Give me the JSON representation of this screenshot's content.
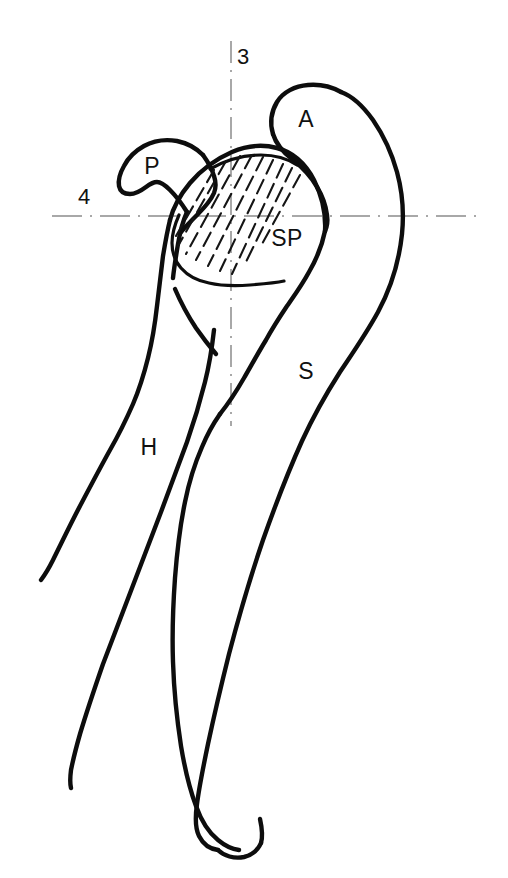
{
  "figure": {
    "background_color": "#ffffff",
    "ink_color": "#0d0d0d",
    "axis_color": "#8c8c8c",
    "width": 508,
    "height": 878
  },
  "labels": {
    "acromion": "A",
    "coracoid_process": "P",
    "supraspinatus": "SP",
    "scapula": "S",
    "humerus": "H"
  },
  "axis_labels": {
    "vertical": "3",
    "horizontal": "4"
  },
  "label_positions": {
    "acromion": {
      "x": 306,
      "y": 121
    },
    "coracoid_process": {
      "x": 152,
      "y": 168
    },
    "supraspinatus": {
      "x": 287,
      "y": 240
    },
    "scapula": {
      "x": 306,
      "y": 373
    },
    "humerus": {
      "x": 149,
      "y": 449
    },
    "vertical_axis": {
      "x": 243,
      "y": 58
    },
    "horizontal_axis": {
      "x": 84,
      "y": 198
    }
  },
  "axes": {
    "vertical": {
      "x": 231,
      "y_start": 41,
      "y_end": 426,
      "style": "dash-dot"
    },
    "horizontal": {
      "y": 216,
      "x_start": 52,
      "x_end": 476,
      "style": "dash-dot"
    }
  },
  "hatching": {
    "description": "supraspinatus muscle belly shaded with parallel oblique dashed strokes",
    "stroke_count": 9,
    "direction": "upper-right to lower-left"
  }
}
